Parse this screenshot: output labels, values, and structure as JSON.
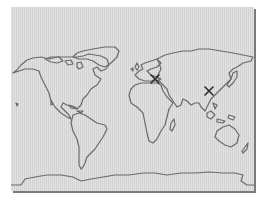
{
  "map": {
    "type": "world-outline",
    "projection": "equirectangular",
    "background_color": "#dadada",
    "coastline_color": "#6a6a6a",
    "marker_color": "#2a2a2a",
    "markers": [
      {
        "name": "marker-middle-east",
        "symbol": "x",
        "x": 144,
        "y": 72
      },
      {
        "name": "marker-east-asia",
        "symbol": "x",
        "x": 198,
        "y": 84
      }
    ]
  }
}
